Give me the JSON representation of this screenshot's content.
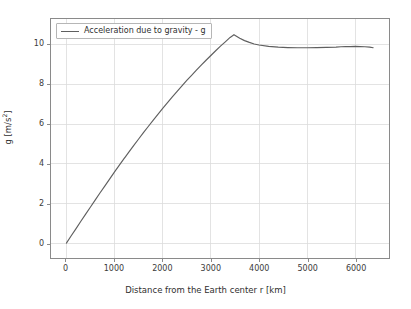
{
  "chart_data": {
    "type": "line",
    "title": "",
    "xlabel": "Distance from the Earth center r [km]",
    "ylabel": "g [m/s²]",
    "xlim": [
      -320,
      6700
    ],
    "ylim": [
      -0.75,
      11.3
    ],
    "grid": true,
    "legend_position": "upper left",
    "xticks": [
      0,
      1000,
      2000,
      3000,
      4000,
      5000,
      6000
    ],
    "xticklabels": [
      "0",
      "1000",
      "2000",
      "3000",
      "4000",
      "5000",
      "6000"
    ],
    "yticks": [
      0,
      2,
      4,
      6,
      8,
      10
    ],
    "yticklabels": [
      "0",
      "2",
      "4",
      "6",
      "8",
      "10"
    ],
    "series": [
      {
        "name": "Acceleration due to gravity - g",
        "color": "#5f5f5f",
        "x": [
          0,
          100,
          200,
          300,
          400,
          500,
          600,
          700,
          800,
          900,
          1000,
          1100,
          1200,
          1221,
          1300,
          1400,
          1500,
          1600,
          1700,
          1800,
          1900,
          2000,
          2100,
          2200,
          2300,
          2400,
          2500,
          2600,
          2700,
          2800,
          2900,
          3000,
          3100,
          3200,
          3300,
          3400,
          3480,
          3600,
          3700,
          3800,
          3900,
          4000,
          4200,
          4400,
          4600,
          4800,
          5000,
          5200,
          5400,
          5600,
          5701,
          5800,
          5900,
          6000,
          6100,
          6200,
          6300,
          6371
        ],
        "y": [
          0.0,
          0.37,
          0.73,
          1.1,
          1.46,
          1.82,
          2.18,
          2.54,
          2.89,
          3.24,
          3.59,
          3.93,
          4.27,
          4.34,
          4.6,
          4.93,
          5.25,
          5.57,
          5.88,
          6.19,
          6.49,
          6.79,
          7.08,
          7.37,
          7.65,
          7.93,
          8.2,
          8.46,
          8.72,
          8.97,
          9.22,
          9.46,
          9.7,
          9.93,
          10.15,
          10.37,
          10.51,
          10.33,
          10.21,
          10.12,
          10.04,
          9.99,
          9.92,
          9.88,
          9.86,
          9.85,
          9.85,
          9.86,
          9.87,
          9.88,
          9.9,
          9.91,
          9.91,
          9.92,
          9.91,
          9.9,
          9.88,
          9.85
        ],
        "peak": {
          "x": 3480,
          "y": 10.51
        },
        "endpoint": {
          "x": 6371,
          "y": 9.85
        }
      }
    ]
  },
  "legend": {
    "entries": [
      {
        "label": "Acceleration due to gravity - g",
        "color": "#5f5f5f"
      }
    ]
  },
  "axes": {
    "xlabel": "Distance from the Earth center r [km]",
    "ylabel_prefix": "g [m/s",
    "ylabel_exponent": "2",
    "ylabel_suffix": "]"
  },
  "colors": {
    "background": "#ffffff",
    "line": "#5f5f5f",
    "grid": "#dcdcdc",
    "spine": "#8a8a8a",
    "text": "#3b3b3b"
  }
}
